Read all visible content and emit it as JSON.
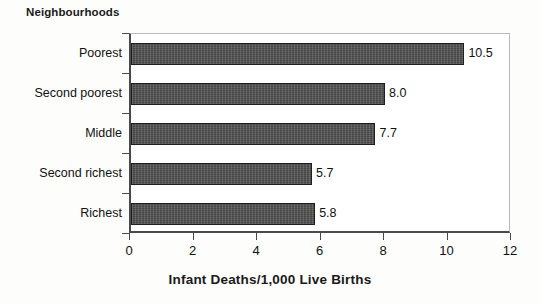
{
  "chart_data": {
    "type": "bar",
    "orientation": "horizontal",
    "title": "",
    "group_title": "Neighbourhoods",
    "categories": [
      "Poorest",
      "Second poorest",
      "Middle",
      "Second richest",
      "Richest"
    ],
    "values": [
      10.5,
      8.0,
      7.7,
      5.7,
      5.8
    ],
    "value_labels": [
      "10.5",
      "8.0",
      "7.7",
      "5.7",
      "5.8"
    ],
    "xlabel": "Infant Deaths/1,000 Live Births",
    "ylabel": "Neighbourhoods",
    "xlim": [
      0,
      12
    ],
    "xticks": [
      0,
      2,
      4,
      6,
      8,
      10,
      12
    ],
    "xtick_labels": [
      "0",
      "2",
      "4",
      "6",
      "8",
      "10",
      "12"
    ],
    "grid": false,
    "legend": false,
    "series_color": "#4f4f4f",
    "axis_color": "#4a4a4a",
    "background": "#ffffff"
  }
}
